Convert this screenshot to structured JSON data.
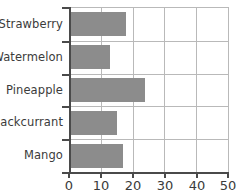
{
  "chart_data": {
    "type": "bar",
    "orientation": "horizontal",
    "title": "",
    "xlabel": "",
    "ylabel": "",
    "categories": [
      "Strawberry",
      "Watermelon",
      "Pineapple",
      "Blackcurrant",
      "Mango"
    ],
    "values": [
      18,
      13,
      24,
      15,
      17
    ],
    "xlim": [
      0,
      50
    ],
    "xticks": [
      0,
      10,
      20,
      30,
      40,
      50
    ],
    "xtick_labels": [
      "0",
      "10",
      "20",
      "30",
      "40",
      "50"
    ],
    "grid": true,
    "legend": false,
    "bar_color": "#8c8c8c",
    "axis_color": "#4a4a4a",
    "grid_color": "#b9b9b9",
    "text_color": "#3b3b3b",
    "background": "#ffffff"
  }
}
